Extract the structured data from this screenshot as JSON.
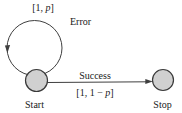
{
  "diagram": {
    "type": "state-transition-diagram",
    "background": "#ffffff",
    "colors": {
      "line": "#3f3f3f",
      "state_fill": "#d0d0d0",
      "state_stroke": "#3a3a3a",
      "text": "#1a1a1a"
    },
    "states": [
      {
        "id": "start",
        "label": "Start"
      },
      {
        "id": "stop",
        "label": "Stop"
      }
    ],
    "transitions": [
      {
        "from": "start",
        "to": "start",
        "name": "Error",
        "probability": {
          "pre": "[1, ",
          "var": "p",
          "post": "]"
        }
      },
      {
        "from": "start",
        "to": "stop",
        "name": "Success",
        "probability": {
          "pre": "[1, 1 − ",
          "var": "p",
          "post": "]"
        }
      }
    ]
  }
}
